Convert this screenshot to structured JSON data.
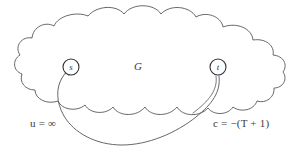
{
  "figure": {
    "type": "graph-diagram",
    "background_color": "#ffffff",
    "stroke_color": "#55565a",
    "text_color": "#3a3a3a",
    "width": 294,
    "height": 153,
    "region": {
      "name": "cloud-region",
      "label": "G",
      "shape": "cloud"
    },
    "nodes": [
      {
        "id": "s",
        "label": "s",
        "role": "source",
        "cx": 71,
        "cy": 67,
        "r": 8
      },
      {
        "id": "t",
        "label": "t",
        "role": "sink",
        "cx": 218,
        "cy": 67,
        "r": 8
      }
    ],
    "edges": [
      {
        "id": "ts-arc",
        "from": "t",
        "to": "s",
        "directed": true,
        "arrowhead_at": "s",
        "capacity_label": "u = ∞",
        "cost_label": "c = −(T + 1)"
      }
    ],
    "labels": {
      "capacity": {
        "variable": "u",
        "relation": "=",
        "value": "∞",
        "text": "u = ∞"
      },
      "cost": {
        "variable": "c",
        "relation": "=",
        "value": "−(T + 1)",
        "text": "c = −(T + 1)"
      },
      "graph": "G",
      "source_node": "s",
      "sink_node": "t"
    }
  }
}
